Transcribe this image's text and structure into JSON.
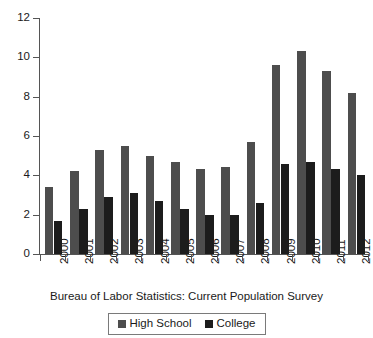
{
  "chart_data": {
    "type": "bar",
    "title": "",
    "subtitle": "",
    "xlabel": "Bureau of Labor Statistics: Current Population Survey",
    "ylabel": "",
    "categories": [
      "2000",
      "2001",
      "2002",
      "2003",
      "2004",
      "2005",
      "2006",
      "2007",
      "2008",
      "2009",
      "2010",
      "2011",
      "2012"
    ],
    "series": [
      {
        "name": "High School",
        "color": "#4d4d4d",
        "values": [
          3.4,
          4.2,
          5.3,
          5.5,
          5.0,
          4.7,
          4.3,
          4.4,
          5.7,
          9.6,
          10.3,
          9.3,
          8.2
        ]
      },
      {
        "name": "College",
        "color": "#1c1c1c",
        "values": [
          1.7,
          2.3,
          2.9,
          3.1,
          2.7,
          2.3,
          2.0,
          2.0,
          2.6,
          4.6,
          4.7,
          4.3,
          4.0
        ]
      }
    ],
    "ylim": [
      0,
      12
    ],
    "yticks": [
      0,
      2,
      4,
      6,
      8,
      10,
      12
    ],
    "ytick_labels": [
      "0",
      "2",
      "4",
      "6",
      "8",
      "10",
      "12"
    ],
    "grid": false,
    "legend_position": "bottom-center"
  },
  "legend": {
    "entries": [
      {
        "label": "High School"
      },
      {
        "label": "College"
      }
    ]
  },
  "axis": {
    "caption": "Bureau of Labor Statistics: Current Population Survey"
  }
}
